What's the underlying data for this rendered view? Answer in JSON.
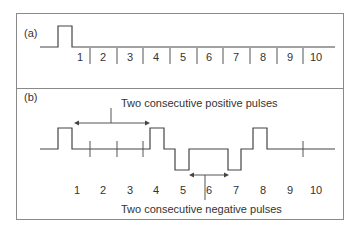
{
  "panels": [
    {
      "label": "(a)",
      "slots": [
        "1",
        "2",
        "3",
        "4",
        "5",
        "6",
        "7",
        "8",
        "9",
        "10"
      ]
    },
    {
      "label": "(b)",
      "slots": [
        "1",
        "2",
        "3",
        "4",
        "5",
        "6",
        "7",
        "8",
        "9",
        "10"
      ],
      "annotations": {
        "top": "Two consecutive positive pulses",
        "bottom": "Two consecutive negative pulses"
      }
    }
  ]
}
